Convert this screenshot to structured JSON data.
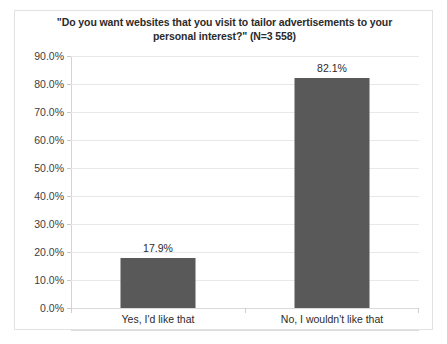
{
  "chart_data": {
    "type": "bar",
    "title": "\"Do you want websites that you visit to tailor advertisements to your personal interest?\" (N=3 558)",
    "title_line1": "\"Do you want websites that you visit to tailor advertisements to your",
    "title_line2": "personal interest?\" (N=3 558)",
    "categories": [
      "Yes, I'd like that",
      "No, I wouldn't like that"
    ],
    "values": [
      17.9,
      82.1
    ],
    "value_labels": [
      "17.9%",
      "82.1%"
    ],
    "xlabel": "",
    "ylabel": "",
    "ylim": [
      0,
      90
    ],
    "ytick_values": [
      0,
      10,
      20,
      30,
      40,
      50,
      60,
      70,
      80,
      90
    ],
    "ytick_labels": [
      "0.0%",
      "10.0%",
      "20.0%",
      "30.0%",
      "40.0%",
      "50.0%",
      "60.0%",
      "70.0%",
      "80.0%",
      "90.0%"
    ],
    "grid": true,
    "legend": false,
    "legend_position": "none",
    "sample_size": "N=3 558",
    "series": [
      {
        "name": "Response share",
        "values": [
          17.9,
          82.1
        ]
      }
    ],
    "colors": {
      "bar": "#595959",
      "gridline": "#e8e8ea",
      "axis": "#d4d4d7",
      "border": "#e2e2e4",
      "background": "#ffffff",
      "text": "#2b2b2b"
    }
  }
}
